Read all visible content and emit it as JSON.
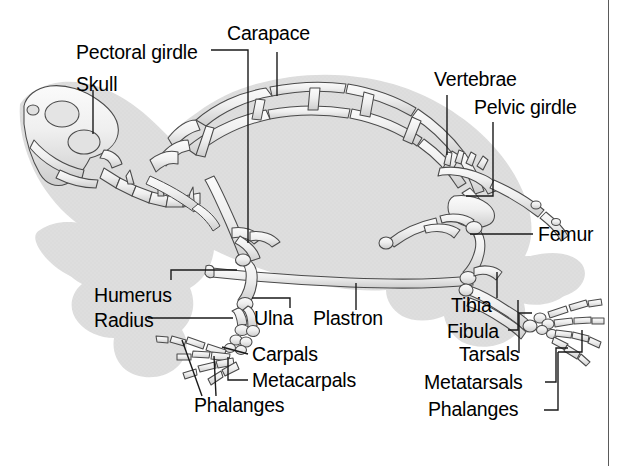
{
  "figure": {
    "view": "lateral",
    "background_color": "#ffffff",
    "shadow_color": "#dcdcdc",
    "bone_fill": "#f2f2f2",
    "bone_stroke": "#4a4a4a",
    "label_color": "#000000",
    "leader_color": "#1a1a1a",
    "border_color": "#5a5a5a"
  },
  "labels": {
    "carapace": "Carapace",
    "pectoral_girdle": "Pectoral girdle",
    "skull": "Skull",
    "vertebrae": "Vertebrae",
    "pelvic_girdle": "Pelvic girdle",
    "femur": "Femur",
    "humerus": "Humerus",
    "radius": "Radius",
    "ulna": "Ulna",
    "plastron": "Plastron",
    "carpals": "Carpals",
    "metacarpals": "Metacarpals",
    "phalanges_front": "Phalanges",
    "tibia": "Tibia",
    "fibula": "Fibula",
    "tarsals": "Tarsals",
    "metatarsals": "Metatarsals",
    "phalanges_hind": "Phalanges"
  },
  "label_positions": {
    "carapace": {
      "x": 227,
      "y": 24
    },
    "pectoral_girdle": {
      "x": 76,
      "y": 43
    },
    "skull": {
      "x": 76,
      "y": 75
    },
    "vertebrae": {
      "x": 434,
      "y": 70
    },
    "pelvic_girdle": {
      "x": 474,
      "y": 98
    },
    "femur": {
      "x": 538,
      "y": 227
    },
    "humerus": {
      "x": 94,
      "y": 286
    },
    "radius": {
      "x": 94,
      "y": 312
    },
    "ulna": {
      "x": 254,
      "y": 316
    },
    "plastron": {
      "x": 313,
      "y": 316
    },
    "carpals": {
      "x": 252,
      "y": 348
    },
    "metacarpals": {
      "x": 252,
      "y": 374
    },
    "phalanges_front": {
      "x": 194,
      "y": 400
    },
    "tibia": {
      "x": 451,
      "y": 304
    },
    "fibula": {
      "x": 447,
      "y": 334
    },
    "tarsals": {
      "x": 459,
      "y": 360
    },
    "metatarsals": {
      "x": 424,
      "y": 388
    },
    "phalanges_hind": {
      "x": 428,
      "y": 416
    }
  }
}
